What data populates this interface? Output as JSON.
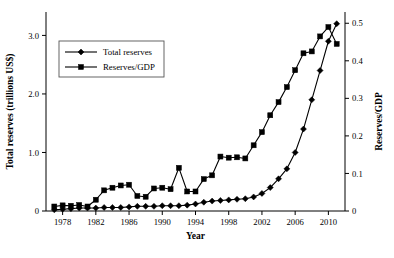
{
  "chart_data": {
    "type": "line",
    "title": "",
    "xlabel": "Year",
    "ylabel": "Total reserves (trillions US$)",
    "y2label": "Reserves/GDP",
    "xlim": [
      1976,
      2012
    ],
    "ylim": [
      0,
      3.4
    ],
    "y2lim": [
      0,
      0.53
    ],
    "grid": false,
    "legend_position": "upper-left-inside",
    "xticks": [
      "1978",
      "1982",
      "1986",
      "1990",
      "1994",
      "1998",
      "2002",
      "2006",
      "2010"
    ],
    "xtick_values": [
      1978,
      1982,
      1986,
      1990,
      1994,
      1998,
      2002,
      2006,
      2010
    ],
    "yticks": [
      "0",
      "1.0",
      "2.0",
      "3.0"
    ],
    "ytick_values": [
      0,
      1.0,
      2.0,
      3.0
    ],
    "y2ticks": [
      "0",
      "0.1",
      "0.2",
      "0.3",
      "0.4",
      "0.5"
    ],
    "y2tick_values": [
      0,
      0.1,
      0.2,
      0.3,
      0.4,
      0.5
    ],
    "x": [
      1977,
      1978,
      1979,
      1980,
      1981,
      1982,
      1983,
      1984,
      1985,
      1986,
      1987,
      1988,
      1989,
      1990,
      1991,
      1992,
      1993,
      1994,
      1995,
      1996,
      1997,
      1998,
      1999,
      2000,
      2001,
      2002,
      2003,
      2004,
      2005,
      2006,
      2007,
      2008,
      2009,
      2010,
      2011
    ],
    "series": [
      {
        "name": "Total reserves",
        "marker": "diamond",
        "axis": "left",
        "unit": "trillions US$",
        "values": [
          0.02,
          0.03,
          0.04,
          0.05,
          0.05,
          0.05,
          0.06,
          0.06,
          0.06,
          0.07,
          0.08,
          0.08,
          0.08,
          0.09,
          0.09,
          0.09,
          0.1,
          0.12,
          0.15,
          0.17,
          0.18,
          0.19,
          0.2,
          0.21,
          0.24,
          0.3,
          0.4,
          0.55,
          0.72,
          1.0,
          1.4,
          1.9,
          2.4,
          2.9,
          3.2
        ]
      },
      {
        "name": "Reserves/GDP",
        "marker": "square",
        "axis": "right",
        "unit": "ratio",
        "values": [
          0.012,
          0.015,
          0.014,
          0.016,
          0.012,
          0.03,
          0.055,
          0.062,
          0.068,
          0.07,
          0.04,
          0.038,
          0.06,
          0.062,
          0.058,
          0.115,
          0.052,
          0.052,
          0.085,
          0.095,
          0.145,
          0.142,
          0.143,
          0.14,
          0.175,
          0.21,
          0.255,
          0.29,
          0.33,
          0.375,
          0.42,
          0.425,
          0.465,
          0.49,
          0.49
        ]
      }
    ],
    "series_end_adjust": {
      "Reserves/GDP_final": 0.445
    },
    "colors": {
      "line": "#000000",
      "marker": "#000000",
      "axis": "#000000",
      "background": "#ffffff",
      "legend_border": "#555555"
    },
    "legend": [
      {
        "label": "Total reserves",
        "marker": "diamond"
      },
      {
        "label": "Reserves/GDP",
        "marker": "square"
      }
    ]
  }
}
